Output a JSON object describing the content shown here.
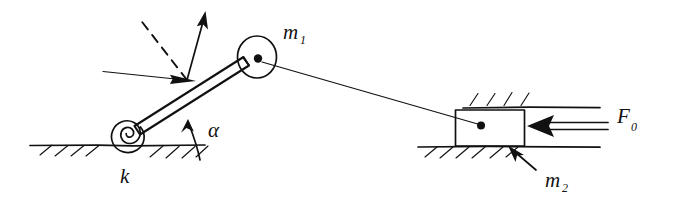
{
  "figure": {
    "domain": "hand-drawn mechanics free-body diagram",
    "background_color": "#ffffff",
    "ink_color": "#111111"
  },
  "labels": {
    "spring_stiffness": {
      "text": "k",
      "sub": "",
      "x": 120,
      "y": 182
    },
    "pulley_mass": {
      "text": "m",
      "sub": "1",
      "x": 283,
      "y": 38
    },
    "block_mass": {
      "text": "m",
      "sub": "2",
      "x": 545,
      "y": 185
    },
    "applied_force": {
      "text": "F",
      "sub": "0",
      "x": 618,
      "y": 122
    },
    "angle": {
      "text": "α",
      "sub": "",
      "x": 212,
      "y": 135
    }
  },
  "components": [
    {
      "name": "torsion-spring",
      "kind": "spiral-spring",
      "label": "k",
      "center": [
        128,
        134
      ],
      "turns": 2.6,
      "outer_radius": 17
    },
    {
      "name": "rocking-bar",
      "kind": "rigid-bar",
      "from": [
        133,
        131
      ],
      "to": [
        247,
        62
      ],
      "thickness": 9,
      "angle_label": "α"
    },
    {
      "name": "pulley-disk",
      "kind": "disk-with-hub",
      "label": "m1",
      "center": [
        257,
        57
      ],
      "radius": 19,
      "hub_radius": 4
    },
    {
      "name": "cable",
      "kind": "line",
      "from": [
        268,
        66
      ],
      "to": [
        477,
        124
      ]
    },
    {
      "name": "slider-block",
      "kind": "rectangle",
      "label": "m2",
      "x": 455,
      "y": 110,
      "width": 69,
      "height": 36,
      "pin": [
        480,
        125
      ]
    },
    {
      "name": "force-arrow",
      "kind": "double-line-arrow",
      "label": "F0",
      "from": [
        608,
        126
      ],
      "to": [
        529,
        126
      ],
      "direction": "left"
    },
    {
      "name": "push-arrow",
      "kind": "single-arrow",
      "from": [
        105,
        72
      ],
      "to": [
        192,
        81
      ],
      "direction": "right"
    },
    {
      "name": "normal-arrow",
      "kind": "single-arrow",
      "from": [
        185,
        80
      ],
      "to": [
        205,
        14
      ],
      "direction": "up-right"
    },
    {
      "name": "reference-dashed-line",
      "kind": "dashed-line",
      "from": [
        186,
        80
      ],
      "to": [
        140,
        20
      ]
    },
    {
      "name": "angle-indicator",
      "kind": "arc-arrow",
      "vertex": [
        186,
        145
      ],
      "from_angle": 0,
      "to_angle": 31
    },
    {
      "name": "ground-left",
      "kind": "hatched-ground",
      "x1": 30,
      "x2": 205,
      "y": 146,
      "hatch_direction": "down-left"
    },
    {
      "name": "ground-right-lower",
      "kind": "hatched-ground",
      "x1": 418,
      "x2": 600,
      "y": 147,
      "hatch_direction": "down-left"
    },
    {
      "name": "guide-rail-upper",
      "kind": "hatched-rail",
      "x1": 463,
      "x2": 600,
      "y": 107,
      "hatch_direction": "up-right"
    },
    {
      "name": "leader-arrow-m2",
      "kind": "single-arrow",
      "from": [
        538,
        172
      ],
      "to": [
        508,
        148
      ],
      "direction": "up-left"
    }
  ]
}
